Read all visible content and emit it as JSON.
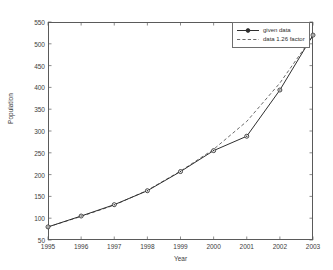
{
  "chart_data": {
    "type": "line",
    "title": "",
    "xlabel": "Year",
    "ylabel": "Population",
    "x": [
      1995,
      1996,
      1997,
      1998,
      1999,
      2000,
      2001,
      2002,
      2003
    ],
    "xtick_labels": [
      "1995",
      "1996",
      "1997",
      "1998",
      "1999",
      "2000",
      "2001",
      "2002",
      "2003"
    ],
    "ytick_labels": [
      "50",
      "100",
      "150",
      "200",
      "250",
      "300",
      "350",
      "400",
      "450",
      "500",
      "550"
    ],
    "ytick_values": [
      50,
      100,
      150,
      200,
      250,
      300,
      350,
      400,
      450,
      500,
      550
    ],
    "xlim": [
      1995,
      2003
    ],
    "ylim": [
      50,
      550
    ],
    "grid": false,
    "legend_position": "top-right",
    "series": [
      {
        "name": "given data",
        "style": "solid",
        "marker": "circle",
        "color": "#2f2f2f",
        "values": [
          80,
          105,
          131,
          163,
          207,
          255,
          288,
          394,
          520
        ]
      },
      {
        "name": "data 1.26 factor",
        "style": "dashed",
        "marker": "none",
        "color": "#6b6b6b",
        "values": [
          80,
          104,
          130,
          164,
          208,
          258,
          322,
          410,
          518
        ]
      }
    ]
  },
  "legend": {
    "entries": [
      {
        "label": "given data"
      },
      {
        "label": "data 1.26 factor"
      }
    ]
  },
  "colors": {
    "axis": "#5a5a5a",
    "text": "#3c3c3c",
    "series1": "#2f2f2f",
    "series2": "#6b6b6b",
    "background": "#ffffff"
  }
}
